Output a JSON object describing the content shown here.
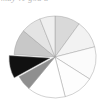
{
  "figure": {
    "type": "pie-chart-figure",
    "background_color": "#ffffff",
    "clipped_header_text": "may ve  gou a",
    "clipped_header_color": "#b9b9b9"
  },
  "chart_data": {
    "type": "pie",
    "title": "",
    "subtitle": "",
    "xlabel": "",
    "ylabel": "",
    "legend": "none",
    "grid": false,
    "units": "percent",
    "start_angle_deg": -90,
    "direction": "clockwise",
    "center_x": 55,
    "center_y": 49,
    "radius": 41,
    "explode_offset_px": 5,
    "categories": [
      "Slice 1",
      "Slice 2",
      "Slice 3",
      "Slice 4",
      "Slice 5",
      "Slice 6",
      "Slice 7",
      "Slice 8",
      "Slice 9",
      "Slice 10"
    ],
    "values": [
      10,
      11,
      13,
      12,
      15,
      6,
      9,
      10,
      8,
      6
    ],
    "colors": [
      "#d9d9d9",
      "#f2f2f2",
      "#fbfbfb",
      "#fdfdfd",
      "#ffffff",
      "#8f8f8f",
      "#111111",
      "#c8c8c8",
      "#e4e4e4",
      "#efefef"
    ],
    "exploded": [
      false,
      false,
      false,
      false,
      false,
      false,
      true,
      false,
      false,
      false
    ],
    "labels_shown": false,
    "border_color": "#9a9a9a"
  }
}
